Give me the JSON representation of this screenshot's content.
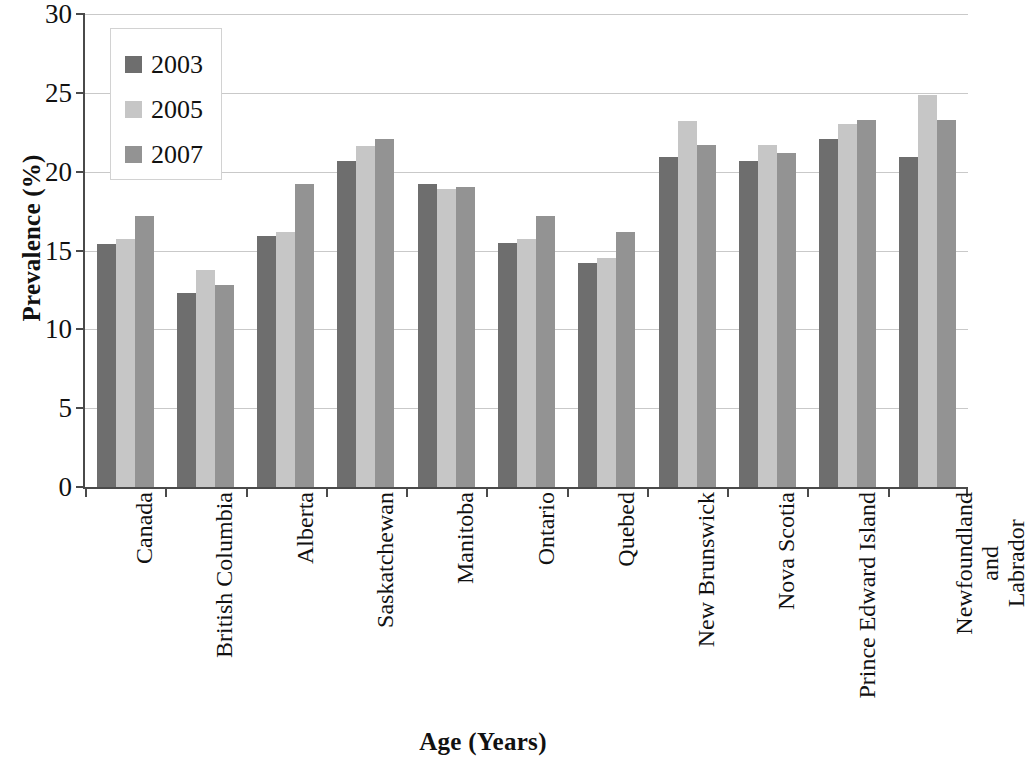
{
  "chart_data": {
    "type": "bar",
    "title": "",
    "xlabel": "Age (Years)",
    "ylabel": "Prevalence (%)",
    "ylim": [
      0,
      30
    ],
    "ytick_step": 5,
    "yticks": [
      30,
      25,
      20,
      15,
      10,
      5,
      0
    ],
    "grid": true,
    "legend_position": "top-left",
    "categories": [
      "Canada",
      "British Columbia",
      "Alberta",
      "Saskatchewan",
      "Manitoba",
      "Ontario",
      "Quebed",
      "New Brunswick",
      "Nova Scotia",
      "Prince Edward Island",
      "Newfoundland and Labrador"
    ],
    "series": [
      {
        "name": "2003",
        "color": "#6e6e6e",
        "values": [
          15.4,
          12.3,
          15.9,
          20.7,
          19.2,
          15.5,
          14.2,
          20.9,
          20.7,
          22.1,
          20.9
        ]
      },
      {
        "name": "2005",
        "color": "#c6c6c6",
        "values": [
          15.7,
          13.75,
          16.2,
          21.6,
          18.9,
          15.7,
          14.5,
          23.2,
          21.7,
          23.0,
          24.85
        ]
      },
      {
        "name": "2007",
        "color": "#939393",
        "values": [
          17.2,
          12.8,
          19.2,
          22.1,
          19.0,
          17.2,
          16.2,
          21.7,
          21.2,
          23.3,
          23.3
        ]
      }
    ]
  },
  "axis": {
    "y_title": "Prevalence (%)",
    "x_title": "Age (Years)"
  },
  "legend": {
    "items": [
      {
        "label": "2003",
        "color": "#6e6e6e"
      },
      {
        "label": "2005",
        "color": "#c6c6c6"
      },
      {
        "label": "2007",
        "color": "#939393"
      }
    ]
  },
  "colors": {
    "series_2003": "#6e6e6e",
    "series_2005": "#c6c6c6",
    "series_2007": "#939393",
    "axis": "#4a4a4a",
    "gridline": "#c9c9c9",
    "background": "#ffffff",
    "text": "#111111"
  },
  "x_label_lines": [
    [
      "Canada"
    ],
    [
      "British Columbia"
    ],
    [
      "Alberta"
    ],
    [
      "Saskatchewan"
    ],
    [
      "Manitoba"
    ],
    [
      "Ontario"
    ],
    [
      "Quebed"
    ],
    [
      "New Brunswick"
    ],
    [
      "Nova Scotia"
    ],
    [
      "Prince Edward Island"
    ],
    [
      "Newfoundland and",
      "Labrador"
    ]
  ]
}
